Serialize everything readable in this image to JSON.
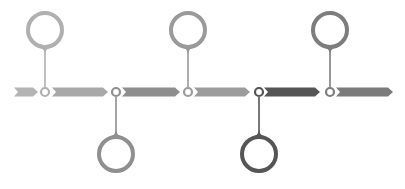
{
  "diagram": {
    "type": "timeline",
    "baseline_y": 92,
    "arrow_height": 9,
    "segments": [
      {
        "x1": 14,
        "x2": 38,
        "color": "#b4b4b4"
      },
      {
        "x1": 52,
        "x2": 108,
        "color": "#a8a8a8"
      },
      {
        "x1": 122,
        "x2": 180,
        "color": "#8e8e8e"
      },
      {
        "x1": 194,
        "x2": 250,
        "color": "#9c9c9c"
      },
      {
        "x1": 264,
        "x2": 320,
        "color": "#555555"
      },
      {
        "x1": 336,
        "x2": 393,
        "color": "#7b7b7b"
      }
    ],
    "milestones": [
      {
        "id": 1,
        "x": 45,
        "direction": "up",
        "color": "#b0b0b0"
      },
      {
        "id": 2,
        "x": 116,
        "direction": "down",
        "color": "#8f8f8f"
      },
      {
        "id": 3,
        "x": 188,
        "direction": "up",
        "color": "#9a9a9a"
      },
      {
        "id": 4,
        "x": 259,
        "direction": "down",
        "color": "#555555"
      },
      {
        "id": 5,
        "x": 330,
        "direction": "up",
        "color": "#7d7d7d"
      }
    ],
    "pin": {
      "circle_radius": 17,
      "circle_stroke": 4,
      "circle_offset": 62,
      "node_radius": 4,
      "node_stroke": 2.2
    }
  }
}
